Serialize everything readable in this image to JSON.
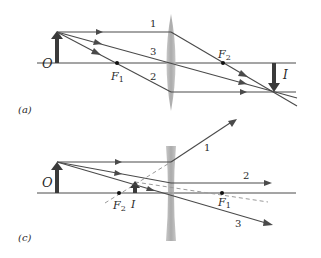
{
  "figures": [
    {
      "id": "a",
      "caption": "(a)",
      "lens_type": "converging",
      "object_label": "O",
      "image_label": "I",
      "focal_points": [
        "F1",
        "F2"
      ],
      "focal_labels": {
        "f1": "F",
        "f1_sub": "1",
        "f2": "F",
        "f2_sub": "2"
      },
      "ray_labels": [
        "1",
        "2",
        "3"
      ]
    },
    {
      "id": "c",
      "caption": "(c)",
      "lens_type": "diverging",
      "object_label": "O",
      "image_label": "I",
      "focal_points": [
        "F2",
        "F1"
      ],
      "focal_labels": {
        "f1": "F",
        "f1_sub": "1",
        "f2": "F",
        "f2_sub": "2"
      },
      "ray_labels": [
        "1",
        "2",
        "3"
      ]
    }
  ],
  "colors": {
    "line": "#4a4a4a",
    "arrow_fill": "#3a3a3a",
    "lens": "#a8a8a8",
    "dashed": "#9a9a9a",
    "text": "#2a2a2a"
  }
}
